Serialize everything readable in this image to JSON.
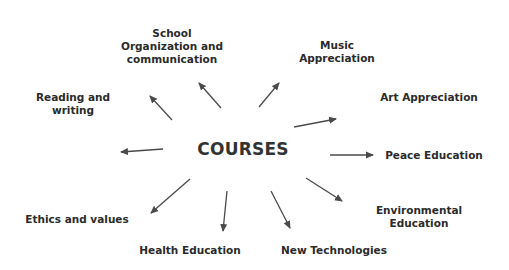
{
  "diagram": {
    "type": "radial-concept-map",
    "colors": {
      "text": "#2b2b2b",
      "arrow": "#4a4a4a",
      "background": "#ffffff"
    },
    "center": {
      "label": "COURSES",
      "x": 243,
      "y": 149
    },
    "nodes": [
      {
        "id": "school",
        "lines": [
          "School",
          "Organization and",
          "communication"
        ],
        "x": 172,
        "y": 46
      },
      {
        "id": "music",
        "lines": [
          "Music",
          "Appreciation"
        ],
        "x": 337,
        "y": 52
      },
      {
        "id": "reading",
        "lines": [
          "Reading and",
          "writing"
        ],
        "x": 73,
        "y": 104
      },
      {
        "id": "art",
        "lines": [
          "Art Appreciation"
        ],
        "x": 429,
        "y": 97
      },
      {
        "id": "peace",
        "lines": [
          "Peace Education"
        ],
        "x": 434,
        "y": 155
      },
      {
        "id": "environmental",
        "lines": [
          "Environmental",
          "Education"
        ],
        "x": 419,
        "y": 217
      },
      {
        "id": "ethics",
        "lines": [
          "Ethics and values"
        ],
        "x": 77,
        "y": 219
      },
      {
        "id": "health",
        "lines": [
          "Health Education"
        ],
        "x": 190,
        "y": 250
      },
      {
        "id": "newtech",
        "lines": [
          "New Technologies"
        ],
        "x": 334,
        "y": 250
      }
    ],
    "arrows": [
      {
        "to": "reading",
        "x1": 172,
        "y1": 120,
        "x2": 150,
        "y2": 96
      },
      {
        "to": "school",
        "x1": 221,
        "y1": 108,
        "x2": 199,
        "y2": 83
      },
      {
        "to": "music",
        "x1": 259,
        "y1": 107,
        "x2": 279,
        "y2": 83
      },
      {
        "to": "art",
        "x1": 294,
        "y1": 127,
        "x2": 336,
        "y2": 119
      },
      {
        "to": "left-blank",
        "x1": 163,
        "y1": 149,
        "x2": 121,
        "y2": 152
      },
      {
        "to": "peace",
        "x1": 330,
        "y1": 155,
        "x2": 373,
        "y2": 155
      },
      {
        "to": "environmental",
        "x1": 306,
        "y1": 178,
        "x2": 342,
        "y2": 201
      },
      {
        "to": "ethics",
        "x1": 190,
        "y1": 179,
        "x2": 151,
        "y2": 213
      },
      {
        "to": "health",
        "x1": 227,
        "y1": 191,
        "x2": 223,
        "y2": 231
      },
      {
        "to": "newtech",
        "x1": 271,
        "y1": 191,
        "x2": 290,
        "y2": 228
      }
    ]
  }
}
